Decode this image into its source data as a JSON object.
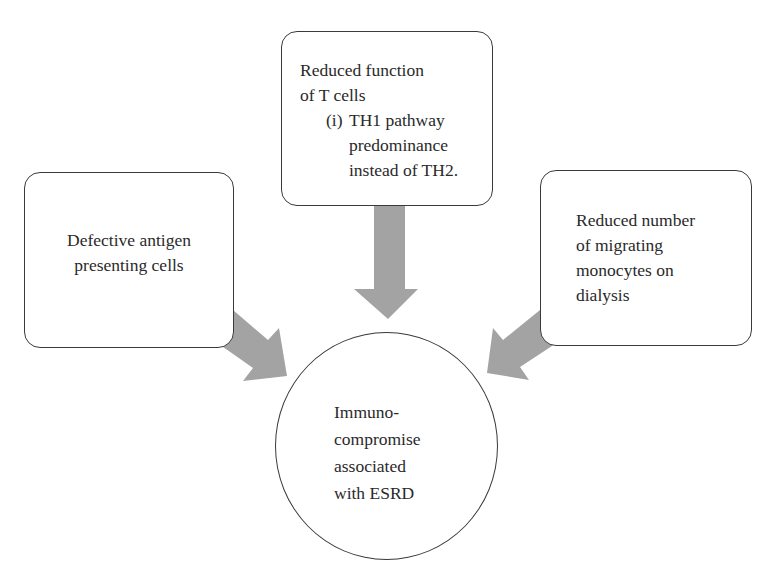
{
  "diagram": {
    "type": "flow",
    "nodes": {
      "top": {
        "id": "reduced-t-cell-function",
        "lines": [
          "Reduced function",
          "of T cells"
        ],
        "sub_items": [
          {
            "marker": "(i)",
            "lines": [
              "TH1 pathway",
              "predominance",
              "instead of TH2."
            ]
          }
        ]
      },
      "left": {
        "id": "defective-apc",
        "lines": [
          "Defective antigen",
          "presenting cells"
        ]
      },
      "right": {
        "id": "reduced-monocytes",
        "lines": [
          "Reduced number",
          "of migrating",
          "monocytes on",
          "dialysis"
        ]
      },
      "center": {
        "id": "immunocompromise-esrd",
        "shape": "circle",
        "lines": [
          "Immuno-",
          "compromise",
          "associated",
          "with ESRD"
        ]
      }
    },
    "edges": [
      {
        "from": "reduced-t-cell-function",
        "to": "immunocompromise-esrd",
        "direction": "down"
      },
      {
        "from": "defective-apc",
        "to": "immunocompromise-esrd",
        "direction": "down-right"
      },
      {
        "from": "reduced-monocytes",
        "to": "immunocompromise-esrd",
        "direction": "down-left"
      }
    ],
    "colors": {
      "arrow": "#a3a3a3",
      "border": "#3a3a3a",
      "text": "#2a2a2a",
      "background": "#ffffff"
    }
  }
}
